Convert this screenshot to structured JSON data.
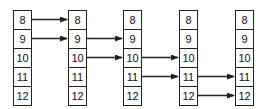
{
  "diagram": {
    "columns": [
      {
        "id": "col1",
        "x": 13,
        "values": [
          "8",
          "9",
          "10",
          "11",
          "12"
        ]
      },
      {
        "id": "col2",
        "x": 68,
        "values": [
          "8",
          "9",
          "10",
          "11",
          "12"
        ]
      },
      {
        "id": "col3",
        "x": 123,
        "values": [
          "8",
          "9",
          "10",
          "11",
          "12"
        ]
      },
      {
        "id": "col4",
        "x": 179,
        "values": [
          "8",
          "9",
          "10",
          "11",
          "12"
        ]
      },
      {
        "id": "col5",
        "x": 235,
        "values": [
          "8",
          "9",
          "10",
          "11",
          "12"
        ]
      }
    ],
    "arrows": [
      {
        "from_col": 0,
        "row": 0
      },
      {
        "from_col": 0,
        "row": 1
      },
      {
        "from_col": 1,
        "row": 1
      },
      {
        "from_col": 1,
        "row": 2
      },
      {
        "from_col": 2,
        "row": 2
      },
      {
        "from_col": 2,
        "row": 3
      },
      {
        "from_col": 3,
        "row": 3
      },
      {
        "from_col": 3,
        "row": 4
      }
    ],
    "colors": {
      "stroke": "#222222",
      "text": "#111111",
      "background": "#ffffff"
    }
  }
}
